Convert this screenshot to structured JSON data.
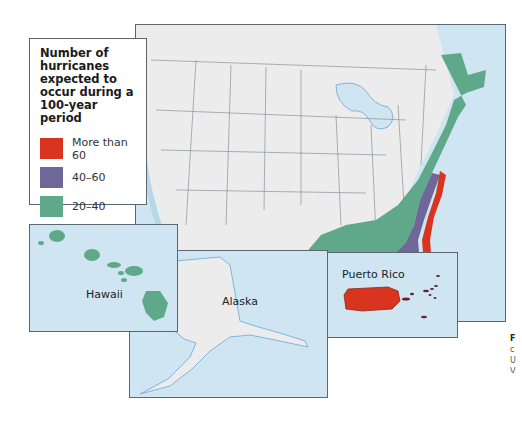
{
  "legend": {
    "title": "Number of hurricanes expected to occur during a 100-year period",
    "title_lines": [
      "Number of",
      "hurricanes",
      "expected to",
      "occur during a",
      "100-year period"
    ],
    "items": [
      {
        "label": "More than 60",
        "color": "#d9341f"
      },
      {
        "label": "40–60",
        "color": "#6f6699"
      },
      {
        "label": "20–40",
        "color": "#5fa889"
      }
    ]
  },
  "colors": {
    "ocean": "#cfe6f2",
    "land": "#ececec",
    "border": "#5b6670",
    "state_lines": "#8a8f96",
    "water_lines": "#6aa6d6"
  },
  "insets": {
    "hawaii": {
      "label": "Hawaii"
    },
    "alaska": {
      "label": "Alaska"
    },
    "puerto_rico": {
      "label": "Puerto Rico"
    }
  },
  "caption_fragment": [
    "F",
    "c",
    "U",
    "V",
    "s"
  ]
}
